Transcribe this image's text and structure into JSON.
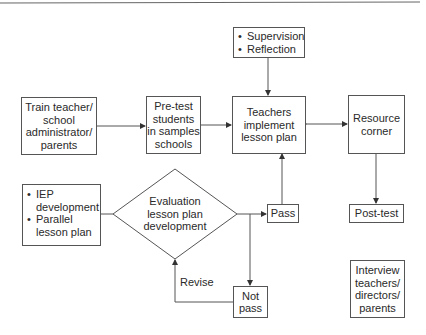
{
  "diagram": {
    "nodes": {
      "train": {
        "lines": [
          "Train teacher/",
          "school",
          "administrator/",
          "parents"
        ]
      },
      "pretest": {
        "lines": [
          "Pre-test",
          "students",
          "in samples",
          "schools"
        ]
      },
      "supervision": {
        "bullets": [
          "Supervision",
          "Reflection"
        ]
      },
      "teachers": {
        "lines": [
          "Teachers",
          "implement",
          "lesson plan"
        ]
      },
      "resource": {
        "lines": [
          "Resource",
          "corner"
        ]
      },
      "posttest": {
        "lines": [
          "Post-test"
        ]
      },
      "iep": {
        "bullets": [
          [
            "IEP",
            "development"
          ],
          [
            "Parallel",
            "lesson plan"
          ]
        ]
      },
      "evaluation": {
        "lines": [
          "Evaluation",
          "lesson plan",
          "development"
        ]
      },
      "pass": {
        "lines": [
          "Pass"
        ]
      },
      "notpass": {
        "lines": [
          "Not",
          "pass"
        ]
      },
      "interview": {
        "lines": [
          "Interview",
          "teachers/",
          "directors/",
          "parents"
        ]
      }
    },
    "edge_labels": {
      "revise": "Revise"
    },
    "bullet_glyph": "•",
    "colors": {
      "line": "#555555",
      "text": "#2a2a2a",
      "background": "#ffffff"
    }
  }
}
